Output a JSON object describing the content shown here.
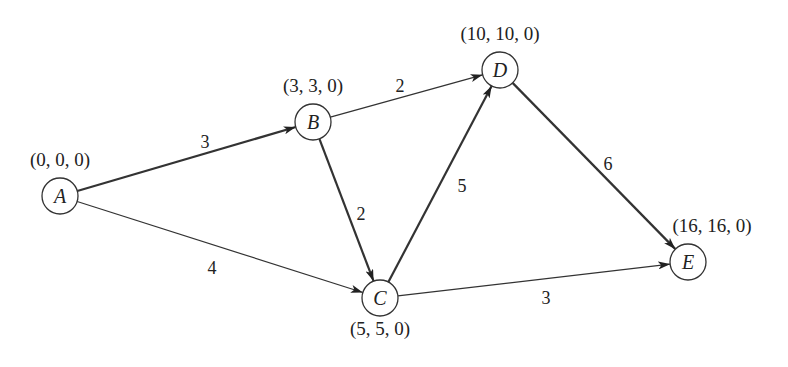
{
  "diagram": {
    "type": "directed-weighted-graph",
    "nodes": [
      {
        "id": "A",
        "label": "A",
        "coord": "(0, 0, 0)",
        "x": 60,
        "y": 196
      },
      {
        "id": "B",
        "label": "B",
        "coord": "(3, 3, 0)",
        "x": 313,
        "y": 122
      },
      {
        "id": "C",
        "label": "C",
        "coord": "(5, 5, 0)",
        "x": 380,
        "y": 298
      },
      {
        "id": "D",
        "label": "D",
        "coord": "(10, 10, 0)",
        "x": 500,
        "y": 70
      },
      {
        "id": "E",
        "label": "E",
        "coord": "(16, 16, 0)",
        "x": 688,
        "y": 262
      }
    ],
    "edges": [
      {
        "from": "A",
        "to": "B",
        "weight": "3",
        "critical": true
      },
      {
        "from": "A",
        "to": "C",
        "weight": "4",
        "critical": false
      },
      {
        "from": "B",
        "to": "D",
        "weight": "2",
        "critical": false
      },
      {
        "from": "B",
        "to": "C",
        "weight": "2",
        "critical": true
      },
      {
        "from": "C",
        "to": "D",
        "weight": "5",
        "critical": true
      },
      {
        "from": "D",
        "to": "E",
        "weight": "6",
        "critical": true
      },
      {
        "from": "C",
        "to": "E",
        "weight": "3",
        "critical": false
      }
    ],
    "colors": {
      "stroke": "#333333",
      "background": "#ffffff",
      "text": "#222222"
    }
  }
}
